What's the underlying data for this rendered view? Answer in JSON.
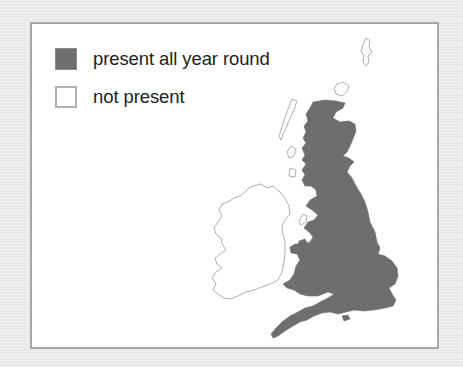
{
  "legend": {
    "items": [
      {
        "label": "present all year round",
        "swatch": "filled",
        "color": "#6e6e6e"
      },
      {
        "label": "not present",
        "swatch": "empty",
        "color": "#ffffff"
      }
    ]
  },
  "map": {
    "regions": [
      {
        "name": "Great Britain (England, Scotland, Wales)",
        "status": "present all year round"
      },
      {
        "name": "Ireland / Northern Ireland",
        "status": "not present"
      },
      {
        "name": "Shetland",
        "status": "not present"
      },
      {
        "name": "Orkney",
        "status": "not present"
      },
      {
        "name": "Outer Hebrides",
        "status": "not present"
      },
      {
        "name": "Isle of Man",
        "status": "not present"
      }
    ],
    "colors": {
      "present": "#6e6e6e",
      "absent_fill": "#ffffff",
      "absent_outline": "#9a9a9a",
      "panel_border": "#a6a6a6",
      "background": "#ececec"
    }
  }
}
